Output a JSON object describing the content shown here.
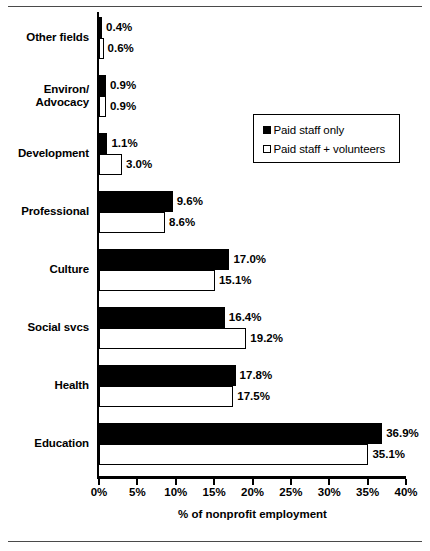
{
  "chart_data": {
    "type": "bar",
    "orientation": "horizontal",
    "title": "",
    "xlabel": "% of nonprofit employment",
    "ylabel": "",
    "xlim": [
      0,
      40
    ],
    "xticks": [
      "0%",
      "5%",
      "10%",
      "15%",
      "20%",
      "25%",
      "30%",
      "35%",
      "40%"
    ],
    "xtick_values": [
      0,
      5,
      10,
      15,
      20,
      25,
      30,
      35,
      40
    ],
    "grid": false,
    "legend_position": "upper right",
    "categories": [
      "Other fields",
      "Environ/ Advocacy",
      "Development",
      "Professional",
      "Culture",
      "Social svcs",
      "Health",
      "Education"
    ],
    "category_lines": [
      [
        "Other fields"
      ],
      [
        "Environ/",
        "Advocacy"
      ],
      [
        "Development"
      ],
      [
        "Professional"
      ],
      [
        "Culture"
      ],
      [
        "Social svcs"
      ],
      [
        "Health"
      ],
      [
        "Education"
      ]
    ],
    "series": [
      {
        "name": "Paid staff only",
        "color": "#000000",
        "values": [
          0.4,
          0.9,
          1.1,
          9.6,
          17.0,
          16.4,
          17.8,
          36.9
        ],
        "labels": [
          "0.4%",
          "0.9%",
          "1.1%",
          "9.6%",
          "17.0%",
          "16.4%",
          "17.8%",
          "36.9%"
        ]
      },
      {
        "name": "Paid staff + volunteers",
        "color": "#ffffff",
        "values": [
          0.6,
          0.9,
          3.0,
          8.6,
          15.1,
          19.2,
          17.5,
          35.1
        ],
        "labels": [
          "0.6%",
          "0.9%",
          "3.0%",
          "8.6%",
          "15.1%",
          "19.2%",
          "17.5%",
          "35.1%"
        ]
      }
    ]
  },
  "legend": {
    "items": [
      {
        "label": "Paid staff only",
        "swatch": "filled-square"
      },
      {
        "label": "Paid staff + volunteers",
        "swatch": "hollow-square"
      }
    ]
  },
  "axis": {
    "x_title": "% of nonprofit employment"
  },
  "colors": {
    "paid_staff": "#000000",
    "paid_staff_volunteers": "#ffffff",
    "axis": "#000000",
    "rule": "#4a4a4a"
  }
}
